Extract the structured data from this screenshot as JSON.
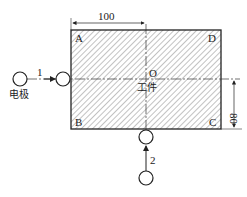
{
  "diagram": {
    "workpiece_label": "工件",
    "electrode_label": "电极",
    "corners": {
      "a": "A",
      "b": "B",
      "c": "C",
      "d": "D"
    },
    "center_label": "O",
    "dimensions": {
      "width": "100",
      "height": "80"
    },
    "moves": {
      "first": "1",
      "second": "2"
    },
    "colors": {
      "line": "#222222",
      "hatch": "#555555",
      "background": "#ffffff"
    }
  }
}
